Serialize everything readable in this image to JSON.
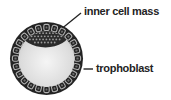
{
  "figure": {
    "labels": {
      "inner_cell_mass": "inner cell mass",
      "trophoblast": "trophoblast"
    },
    "colors": {
      "background": "#ffffff",
      "ink": "#232323",
      "cell_outline": "#b2b2b2",
      "cell_center": "#6f6f6f",
      "cavity_center": "#f5f5f5",
      "cavity_edge": "#c5c5c5",
      "icm_fill": "#2b2b2b",
      "icm_speckle": "#9a9a9a"
    }
  }
}
